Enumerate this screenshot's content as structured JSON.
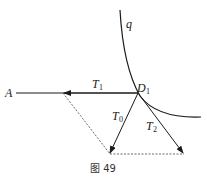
{
  "diagram": {
    "labels": {
      "A": "A",
      "q": "q",
      "D1_main": "D",
      "D1_sub": "1",
      "T1_main": "T",
      "T1_sub": "1",
      "T0_main": "T",
      "T0_sub": "0",
      "T2_main": "T",
      "T2_sub": "2"
    },
    "caption": "图 49",
    "colors": {
      "line": "#1a1a1a",
      "dashed": "#444444"
    }
  }
}
